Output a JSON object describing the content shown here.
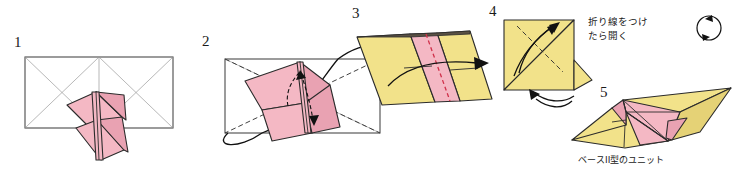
{
  "page": {
    "title": "ベースII型のユニット",
    "background_color": "#ffffff",
    "width": 740,
    "height": 176,
    "kind": "origami-instruction-diagram"
  },
  "colors": {
    "paper_pink": "#f4b8c4",
    "paper_pink_shade": "#e9a2b2",
    "paper_yellow": "#f2e28a",
    "paper_yellow_shade": "#e5d276",
    "outline_gray": "#4a4a4a",
    "crease_gray": "#9a9a9a",
    "crease_red": "#d0304a",
    "ink_black": "#111111",
    "text_black": "#1a1a1a"
  },
  "steps": [
    {
      "id": "step-1",
      "number": "1",
      "label_x": 14,
      "label_y": 47,
      "description": "Rectangle with X creases, pink flap in center"
    },
    {
      "id": "step-2",
      "number": "2",
      "label_x": 202,
      "label_y": 46,
      "description": "Rectangle with dashed diagonals, push arrows, wrap-around curve"
    },
    {
      "id": "step-3",
      "number": "3",
      "label_x": 352,
      "label_y": 18,
      "description": "Parallelogram, yellow with pink center band and red dashed crease"
    },
    {
      "id": "step-4",
      "number": "4",
      "label_x": 489,
      "label_y": 16,
      "description": "Yellow triangle with dashed crease and curved arrow, flip over"
    },
    {
      "id": "step-5",
      "number": "5",
      "label_x": 600,
      "label_y": 97,
      "description": "Finished base II unit, yellow wings with pink core"
    }
  ],
  "annotations": [
    {
      "id": "fold-open-note",
      "lines": [
        "折り線をつけ",
        "たら開く"
      ],
      "x": 588,
      "y": 22,
      "meaning": "Make the crease lines, then open"
    }
  ],
  "caption": {
    "id": "unit-caption",
    "text": "ベースII型のユニット",
    "x": 578,
    "y": 163,
    "meaning": "Base II type unit"
  },
  "icons": [
    {
      "id": "rotate-icon",
      "name": "rotate-icon",
      "x": 709,
      "y": 28,
      "radius": 12,
      "description": "Circular two-headed rotation arrow"
    },
    {
      "id": "flip-over-icon",
      "name": "flip-over-arrow-icon",
      "x": 548,
      "y": 100,
      "description": "Curled flip-the-model-over arrow under step 4"
    }
  ]
}
